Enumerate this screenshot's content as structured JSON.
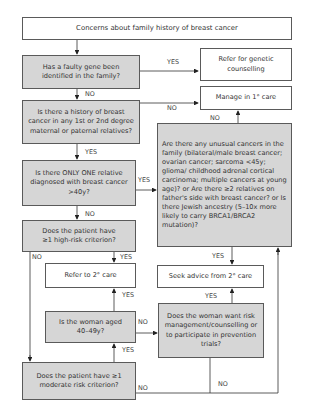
{
  "flowchart": {
    "title": "Concerns about family history of breast cancer",
    "nodes": {
      "faulty_gene": "Has a faulty gene been identified in the family?",
      "refer_genetic": "Refer for genetic counselling",
      "manage_primary": "Manage in 1° care",
      "history": "Is there a history of breast cancer in any 1st or 2nd degree maternal or paternal relatives?",
      "only_one": "Is there ONLY ONE relative diagnosed with breast cancer >40y?",
      "unusual": "Are there any unusual cancers in the family (bilateral/male breast cancer; ovarian cancer; sarcoma <45y; glioma/ childhood adrenal cortical carcinoma; multiple cancers at young age)? or Are there ≥2 relatives on father's side with breast cancer? or Is there Jewish ancestry (5–10x more likely to carry BRCA1/BRCA2 mutation)?",
      "high_risk": "Does the patient have ≥1 high-risk criterion?",
      "refer_secondary": "Refer to 2° care",
      "seek_advice": "Seek advice from 2° care",
      "aged": "Is the woman aged 40–49y?",
      "risk_mgmt": "Does the woman want risk management/counselling or to participate in prevention trials?",
      "moderate_risk": "Does the patient have ≥1 moderate risk criterion?"
    },
    "edge_labels": {
      "yes": "YES",
      "no": "NO"
    },
    "colors": {
      "question_fill": "#d6d6d6",
      "outcome_fill": "#ffffff",
      "line": "#333333"
    }
  }
}
